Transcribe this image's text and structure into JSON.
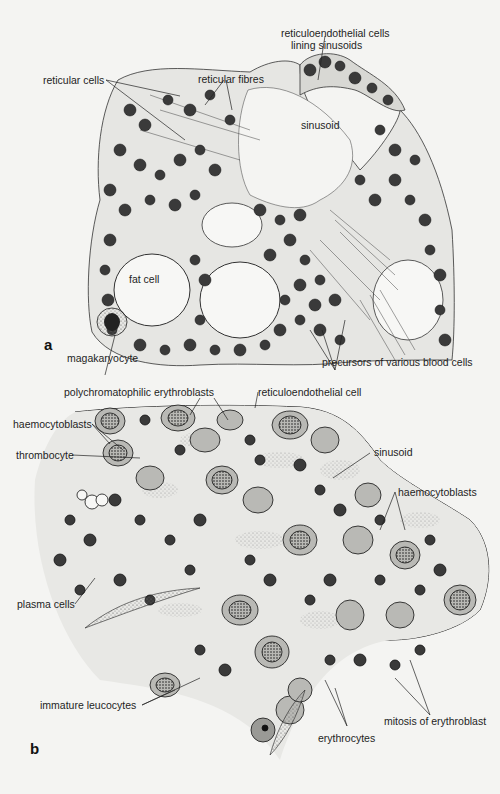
{
  "panel_a": {
    "letter": "a",
    "labels": {
      "reticuloendothelial_line1": "reticuloendothelial cells",
      "reticuloendothelial_line2": "lining sinusoids",
      "reticular_cells": "reticular cells",
      "reticular_fibres": "reticular fibres",
      "sinusoid": "sinusoid",
      "fat_cell": "fat cell",
      "megakaryocyte": "magakaryocyte",
      "precursors": "precursors of various blood cells"
    }
  },
  "panel_b": {
    "letter": "b",
    "labels": {
      "polychromatophilic": "polychromatophilic erythroblasts",
      "reticuloendothelial_cell": "reticuloendothelial cell",
      "haemocytoblasts_left": "haemocytoblasts",
      "thrombocyte": "thrombocyte",
      "sinusoid": "sinusoid",
      "haemocytoblasts_right": "haemocytoblasts",
      "plasma_cells": "plasma cells",
      "immature_leucocytes": "immature leucocytes",
      "mitosis": "mitosis of erythroblast",
      "erythrocytes": "erythrocytes"
    }
  },
  "colors": {
    "background": "#f4f4f2",
    "ink": "#1a1a1a",
    "cytoplasm_shade": "#9a9a9a",
    "nucleus": "#2a2a2a"
  }
}
